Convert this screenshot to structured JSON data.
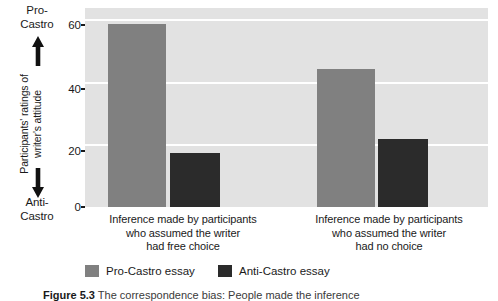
{
  "figure": {
    "caption_label": "Figure 5.3",
    "caption_text": "The correspondence bias: People made the inference"
  },
  "axis": {
    "y_title_line1": "Participants' ratings of",
    "y_title_line2": "writer's attitude",
    "y_pole_top_line1": "Pro-",
    "y_pole_top_line2": "Castro",
    "y_pole_bottom_line1": "Anti-",
    "y_pole_bottom_line2": "Castro",
    "y_ticks": [
      "60",
      "40",
      "20",
      "0"
    ],
    "y_tick_values": [
      60,
      40,
      20,
      0
    ]
  },
  "legend": {
    "items": [
      {
        "label": "Pro-Castro essay",
        "color": "#808080"
      },
      {
        "label": "Anti-Castro essay",
        "color": "#2b2b2b"
      }
    ]
  },
  "chart_data": {
    "type": "bar",
    "title": "",
    "xlabel": "",
    "ylabel": "Participants' ratings of writer's attitude",
    "ylim": [
      0,
      64
    ],
    "grid": true,
    "grid_color": "#ffffff",
    "plot_background": "#e2e2e2",
    "legend_position": "bottom-left",
    "categories": [
      "Inference made by participants who assumed the writer had free choice",
      "Inference made by participants who assumed the writer had no choice"
    ],
    "category_lines": [
      [
        "Inference made by participants",
        "who assumed the writer",
        "had free choice"
      ],
      [
        "Inference made by participants",
        "who assumed the writer",
        "had no choice"
      ]
    ],
    "series": [
      {
        "name": "Pro-Castro essay",
        "color": "#808080",
        "values": [
          59,
          44.5
        ]
      },
      {
        "name": "Anti-Castro essay",
        "color": "#2b2b2b",
        "values": [
          17.5,
          22
        ]
      }
    ],
    "y_axis_poles": {
      "high": "Pro-Castro",
      "low": "Anti-Castro"
    }
  }
}
